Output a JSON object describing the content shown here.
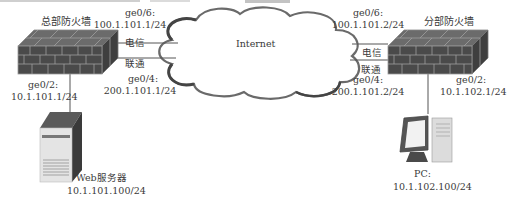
{
  "diagram": {
    "cloud": {
      "label": "Internet"
    },
    "hq_firewall": {
      "name": "总部防火墙",
      "wan1": {
        "port": "ge0/6:",
        "ip": "100.1.101.1/24",
        "isp": "电信"
      },
      "wan2": {
        "port": "ge0/4:",
        "ip": "200.1.101.1/24",
        "isp": "联通"
      },
      "lan": {
        "port": "ge0/2:",
        "ip": "10.1.101.1/24"
      }
    },
    "branch_firewall": {
      "name": "分部防火墙",
      "wan1": {
        "port": "ge0/6:",
        "ip": "100.1.101.2/24",
        "isp": "电信"
      },
      "wan2": {
        "port": "ge0/4:",
        "ip": "200.1.101.2/24",
        "isp": "联通"
      },
      "lan": {
        "port": "ge0/2:",
        "ip": "10.1.102.1/24"
      }
    },
    "web_server": {
      "name": "Web服务器",
      "ip": "10.1.101.100/24"
    },
    "pc": {
      "name": "PC:",
      "ip": "10.1.102.100/24"
    },
    "colors": {
      "brick_dark": "#4a4a4a",
      "brick_mortar": "#9a9a9a",
      "line": "#555555",
      "cloud_stroke": "#6a6a6a"
    }
  }
}
